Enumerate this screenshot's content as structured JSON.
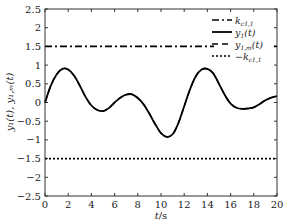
{
  "chart_data": {
    "type": "line",
    "title": "",
    "xlabel": "t/s",
    "ylabel": "y1(t), y1,m(t)",
    "xlim": [
      0,
      20
    ],
    "ylim": [
      -2.5,
      2.5
    ],
    "xticks": [
      0,
      2,
      4,
      6,
      8,
      10,
      12,
      14,
      16,
      18,
      20
    ],
    "yticks": [
      2.5,
      2,
      1.5,
      1,
      0.5,
      0,
      -0.5,
      -1,
      -1.5,
      -2,
      -2.5
    ],
    "ytick_labels": [
      "2.5",
      "2",
      "1.5",
      "1",
      "0.5",
      "0",
      "−0.5",
      "−1",
      "−1.5",
      "−2",
      "−2.5"
    ],
    "grid": false,
    "legend_position": "upper right",
    "x": [
      0,
      0.5,
      1,
      1.5,
      2,
      2.5,
      3,
      3.5,
      4,
      4.5,
      5,
      5.5,
      6,
      6.5,
      7,
      7.5,
      8,
      8.5,
      9,
      9.5,
      10,
      10.5,
      11,
      11.5,
      12,
      12.5,
      13,
      13.5,
      14,
      14.5,
      15,
      15.5,
      16,
      16.5,
      17,
      17.5,
      18,
      18.5,
      19,
      19.5,
      20
    ],
    "series": [
      {
        "name": "k_c1,1",
        "legend": "k",
        "legend_sub": "c1,1",
        "style": "dashdot",
        "values": [
          1.5,
          1.5,
          1.5,
          1.5,
          1.5,
          1.5,
          1.5,
          1.5,
          1.5,
          1.5,
          1.5,
          1.5,
          1.5,
          1.5,
          1.5,
          1.5,
          1.5,
          1.5,
          1.5,
          1.5,
          1.5,
          1.5,
          1.5,
          1.5,
          1.5,
          1.5,
          1.5,
          1.5,
          1.5,
          1.5,
          1.5,
          1.5,
          1.5,
          1.5,
          1.5,
          1.5,
          1.5,
          1.5,
          1.5,
          1.5,
          1.5
        ]
      },
      {
        "name": "y1(t)",
        "legend": "y",
        "legend_sub": "1",
        "legend_tail": "(t)",
        "style": "solid",
        "values": [
          0.0,
          0.45,
          0.75,
          0.9,
          0.88,
          0.72,
          0.45,
          0.15,
          -0.08,
          -0.2,
          -0.23,
          -0.15,
          0.0,
          0.13,
          0.21,
          0.22,
          0.12,
          -0.05,
          -0.3,
          -0.58,
          -0.82,
          -0.92,
          -0.85,
          -0.55,
          -0.1,
          0.35,
          0.7,
          0.88,
          0.9,
          0.78,
          0.5,
          0.2,
          -0.03,
          -0.14,
          -0.17,
          -0.16,
          -0.13,
          -0.04,
          0.06,
          0.13,
          0.17
        ]
      },
      {
        "name": "y1,m(t)",
        "legend": "y",
        "legend_sub": "1,m",
        "legend_tail": "(t)",
        "style": "dashed",
        "values": [
          0.0,
          0.45,
          0.75,
          0.9,
          0.88,
          0.72,
          0.45,
          0.15,
          -0.08,
          -0.2,
          -0.23,
          -0.15,
          0.0,
          0.13,
          0.21,
          0.22,
          0.12,
          -0.05,
          -0.3,
          -0.58,
          -0.82,
          -0.92,
          -0.85,
          -0.55,
          -0.1,
          0.35,
          0.7,
          0.88,
          0.9,
          0.78,
          0.5,
          0.2,
          -0.03,
          -0.14,
          -0.17,
          -0.16,
          -0.13,
          -0.04,
          0.06,
          0.13,
          0.17
        ]
      },
      {
        "name": "-k_c1,1",
        "legend": "−k",
        "legend_sub": "c1,1",
        "style": "dotted",
        "values": [
          -1.5,
          -1.5,
          -1.5,
          -1.5,
          -1.5,
          -1.5,
          -1.5,
          -1.5,
          -1.5,
          -1.5,
          -1.5,
          -1.5,
          -1.5,
          -1.5,
          -1.5,
          -1.5,
          -1.5,
          -1.5,
          -1.5,
          -1.5,
          -1.5,
          -1.5,
          -1.5,
          -1.5,
          -1.5,
          -1.5,
          -1.5,
          -1.5,
          -1.5,
          -1.5,
          -1.5,
          -1.5,
          -1.5,
          -1.5,
          -1.5,
          -1.5,
          -1.5,
          -1.5,
          -1.5,
          -1.5,
          -1.5
        ]
      }
    ]
  },
  "labels": {
    "xlabel_t": "t",
    "xlabel_unit": "/s",
    "ylabel_text": "y₁(t), y₁,ₘ(t)"
  }
}
